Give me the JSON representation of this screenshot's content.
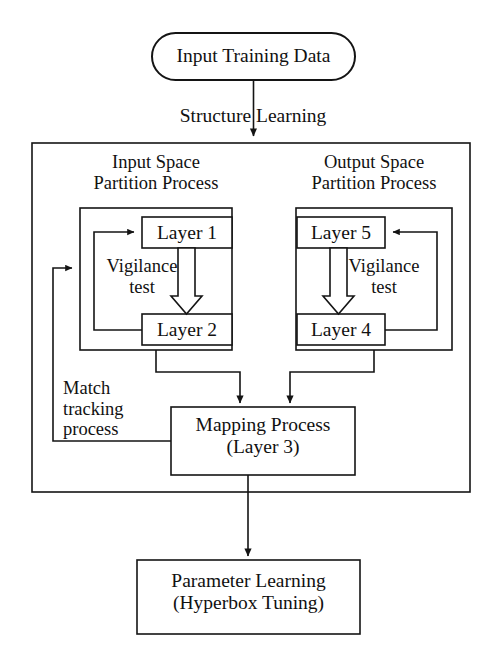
{
  "diagram": {
    "stroke_color": "#141414",
    "fill_color": "#ffffff",
    "background": "#ffffff"
  },
  "nodes": {
    "input_data": {
      "label": "Input Training Data",
      "shape": "rounded-rectangle"
    },
    "structure_learning": {
      "label": "Structure Learning",
      "shape": "edge-label"
    },
    "input_space": {
      "label": "Input Space\nPartition Process",
      "shape": "group-label"
    },
    "output_space": {
      "label": "Output Space\nPartition Process",
      "shape": "group-label"
    },
    "layer1": {
      "label": "Layer 1",
      "shape": "rectangle"
    },
    "layer2": {
      "label": "Layer 2",
      "shape": "rectangle"
    },
    "layer5": {
      "label": "Layer 5",
      "shape": "rectangle"
    },
    "layer4": {
      "label": "Layer 4",
      "shape": "rectangle"
    },
    "vigilance_left": {
      "label": "Vigilance\ntest",
      "shape": "text"
    },
    "vigilance_right": {
      "label": "Vigilance\ntest",
      "shape": "text"
    },
    "match_tracking": {
      "label": "Match\ntracking\nprocess",
      "shape": "text"
    },
    "mapping_process": {
      "label": "Mapping Process\n(Layer 3)",
      "shape": "rectangle"
    },
    "parameter_learning": {
      "label": "Parameter Learning\n(Hyperbox Tuning)",
      "shape": "rectangle"
    }
  },
  "edges": [
    {
      "id": "e1",
      "from": "input_data",
      "to": "structure_learning_box",
      "label": "Structure Learning",
      "arrow": "filled"
    },
    {
      "id": "e2",
      "from": "match_tracking",
      "to": "input_space_group",
      "arrow": "filled"
    },
    {
      "id": "e3",
      "from": "layer2",
      "to": "layer1",
      "arrow": "filled"
    },
    {
      "id": "e4",
      "from": "layer1",
      "to": "layer2",
      "arrow": "hollow-block"
    },
    {
      "id": "e5",
      "from": "layer5",
      "to": "layer4",
      "arrow": "hollow-block"
    },
    {
      "id": "e6",
      "from": "layer4",
      "to": "layer5",
      "arrow": "filled"
    },
    {
      "id": "e7",
      "from": "input_space_group",
      "to": "mapping_process",
      "arrow": "filled"
    },
    {
      "id": "e8",
      "from": "output_space_group",
      "to": "mapping_process",
      "arrow": "filled"
    },
    {
      "id": "e9",
      "from": "mapping_process",
      "to": "match_tracking_path",
      "arrow": "none"
    },
    {
      "id": "e10",
      "from": "mapping_process",
      "to": "parameter_learning",
      "arrow": "filled"
    }
  ]
}
